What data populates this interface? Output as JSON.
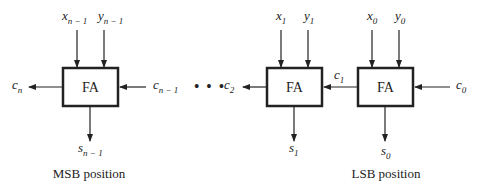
{
  "diagram": {
    "blocks": [
      {
        "id": "fa_msb",
        "label": "FA",
        "x_in": "x",
        "x_sub": "n − 1",
        "y_in": "y",
        "y_sub": "n − 1",
        "c_in": "c",
        "c_in_sub": "n − 1",
        "c_out": "c",
        "c_out_sub": "n",
        "s_out": "s",
        "s_sub": "n − 1",
        "caption": "MSB position"
      },
      {
        "id": "fa_1",
        "label": "FA",
        "x_in": "x",
        "x_sub": "1",
        "y_in": "y",
        "y_sub": "1",
        "c_out": "c",
        "c_out_sub": "2",
        "s_out": "s",
        "s_sub": "1"
      },
      {
        "id": "fa_0",
        "label": "FA",
        "x_in": "x",
        "x_sub": "0",
        "y_in": "y",
        "y_sub": "0",
        "c_in": "c",
        "c_in_sub": "0",
        "c_out": "c",
        "c_out_sub": "1",
        "s_out": "s",
        "s_sub": "0",
        "caption": "LSB position"
      }
    ],
    "ellipsis": "• • •"
  }
}
